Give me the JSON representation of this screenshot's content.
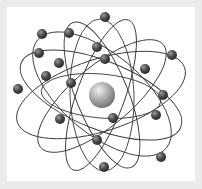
{
  "image": {
    "subject": "atom-model-illustration",
    "colors": {
      "frame": "#ebebeb",
      "panel": "#ffffff",
      "orbit": "#3a3a3a",
      "electron_dark": "#3c3c3c",
      "electron_light": "#9a9a9a",
      "nucleus_dark": "#7a7a7a",
      "nucleus_light": "#e8e8e8"
    },
    "nucleus": {
      "cx": 102,
      "cy": 95,
      "r": 13
    },
    "orbits": [
      {
        "cx": 101,
        "cy": 95,
        "rx": 88,
        "ry": 36,
        "rot": -18
      },
      {
        "cx": 101,
        "cy": 95,
        "rx": 86,
        "ry": 34,
        "rot": 22
      },
      {
        "cx": 102,
        "cy": 94,
        "rx": 84,
        "ry": 40,
        "rot": 40
      },
      {
        "cx": 102,
        "cy": 96,
        "rx": 80,
        "ry": 30,
        "rot": -40
      },
      {
        "cx": 102,
        "cy": 95,
        "rx": 78,
        "ry": 26,
        "rot": 68
      },
      {
        "cx": 101,
        "cy": 95,
        "rx": 80,
        "ry": 24,
        "rot": -70
      },
      {
        "cx": 102,
        "cy": 95,
        "rx": 76,
        "ry": 32,
        "rot": 88
      },
      {
        "cx": 101,
        "cy": 96,
        "rx": 60,
        "ry": 22,
        "rot": 5
      }
    ],
    "electrons": [
      {
        "cx": 105,
        "cy": 17
      },
      {
        "cx": 42,
        "cy": 34
      },
      {
        "cx": 69,
        "cy": 33
      },
      {
        "cx": 39,
        "cy": 53
      },
      {
        "cx": 97,
        "cy": 47
      },
      {
        "cx": 172,
        "cy": 55
      },
      {
        "cx": 59,
        "cy": 63
      },
      {
        "cx": 105,
        "cy": 59
      },
      {
        "cx": 46,
        "cy": 76
      },
      {
        "cx": 71,
        "cy": 83
      },
      {
        "cx": 145,
        "cy": 69
      },
      {
        "cx": 18,
        "cy": 89
      },
      {
        "cx": 163,
        "cy": 95
      },
      {
        "cx": 60,
        "cy": 119
      },
      {
        "cx": 113,
        "cy": 118
      },
      {
        "cx": 156,
        "cy": 115
      },
      {
        "cx": 97,
        "cy": 140
      },
      {
        "cx": 161,
        "cy": 157
      },
      {
        "cx": 104,
        "cy": 167
      }
    ],
    "electron_radius": 5
  }
}
